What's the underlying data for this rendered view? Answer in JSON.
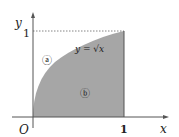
{
  "diagram": {
    "axis_x_label": "x",
    "axis_y_label": "y",
    "origin_label": "O",
    "x_tick_label": "1",
    "y_tick_label": "1",
    "curve_label": "y = √x",
    "region_a_label": "ⓐ",
    "region_b_label": "ⓑ",
    "colors": {
      "shaded_region": "#a6a6a6",
      "axes": "#555555",
      "text": "#222222"
    }
  }
}
